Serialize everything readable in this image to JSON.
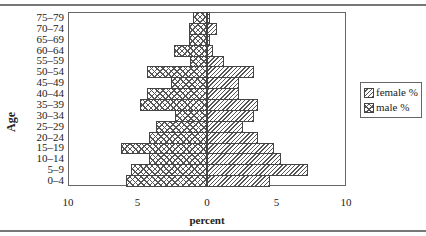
{
  "chart_data": {
    "type": "bar",
    "subtype": "population-pyramid",
    "title": "",
    "xlabel": "percent",
    "ylabel": "Age",
    "x_ticks": [
      "10",
      "5",
      "0",
      "5",
      "10"
    ],
    "xlim": [
      -10,
      10
    ],
    "grid": false,
    "legend_position": "right",
    "categories": [
      "75–79",
      "70–74",
      "65–69",
      "60–64",
      "55–59",
      "50–54",
      "45–49",
      "40–44",
      "35–39",
      "30–34",
      "25–29",
      "20–24",
      "15–19",
      "10–14",
      "5–9",
      "0–4"
    ],
    "series": [
      {
        "name": "female %",
        "side": "right",
        "pattern": "diagonal-hatch",
        "values": [
          0.2,
          0.7,
          0.2,
          0.4,
          1.2,
          3.4,
          2.3,
          2.3,
          3.7,
          3.4,
          2.6,
          3.7,
          4.8,
          5.3,
          7.3,
          4.5
        ]
      },
      {
        "name": "male %",
        "side": "left",
        "pattern": "cross-hatch",
        "values": [
          1.0,
          1.3,
          1.3,
          2.4,
          1.2,
          4.3,
          2.6,
          4.3,
          4.8,
          2.3,
          3.7,
          4.2,
          6.2,
          4.2,
          5.5,
          5.8
        ]
      }
    ]
  },
  "legend": {
    "female": "female %",
    "male": "male %"
  }
}
